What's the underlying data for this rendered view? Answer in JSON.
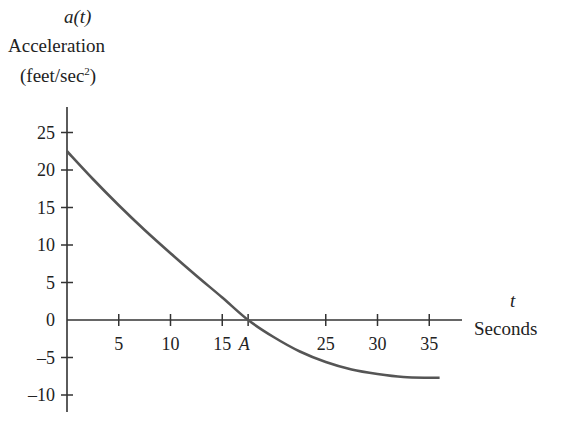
{
  "chart_data": {
    "type": "line",
    "title": "",
    "ylabel_func": "a(t)",
    "ylabel": "Acceleration",
    "yunits": "(feet/sec²)",
    "xlabel_var": "t",
    "xlabel": "Seconds",
    "x_ticks": [
      "5",
      "10",
      "15",
      "A",
      "25",
      "30",
      "35"
    ],
    "x_tick_values": [
      5,
      10,
      15,
      17.5,
      25,
      30,
      35
    ],
    "y_ticks": [
      "25",
      "20",
      "15",
      "10",
      "5",
      "0",
      "-5",
      "-10"
    ],
    "y_tick_values": [
      25,
      20,
      15,
      10,
      5,
      0,
      -5,
      -10
    ],
    "xlim": [
      0,
      38
    ],
    "ylim": [
      -12,
      28
    ],
    "grid": false,
    "annotations": [
      {
        "label": "A",
        "x": 17.5,
        "y": 0,
        "note": "curve crosses t-axis"
      }
    ],
    "series": [
      {
        "name": "a(t)",
        "x": [
          0,
          2.5,
          5,
          7.5,
          10,
          12.5,
          15,
          17.5,
          20,
          22.5,
          25,
          27.5,
          30,
          32.5,
          35,
          36
        ],
        "values": [
          22.5,
          18.8,
          15.3,
          12.0,
          8.9,
          5.9,
          3.0,
          0,
          -2.3,
          -4.2,
          -5.6,
          -6.6,
          -7.2,
          -7.6,
          -7.7,
          -7.7
        ]
      }
    ]
  },
  "labels": {
    "func": "a(t)",
    "quantity": "Acceleration",
    "units_prefix": "(feet/sec",
    "units_sup": "2",
    "units_suffix": ")",
    "xvar": "t",
    "xname": "Seconds"
  }
}
